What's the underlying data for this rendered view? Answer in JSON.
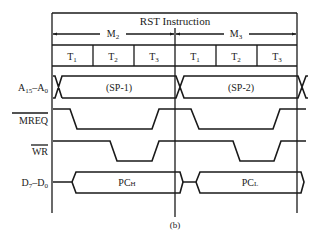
{
  "diagram": {
    "title": "RST Instruction",
    "caption": "(b)",
    "machine_cycles": [
      {
        "label": "M",
        "sub": "2",
        "states": [
          {
            "label": "T",
            "sub": "1"
          },
          {
            "label": "T",
            "sub": "2"
          },
          {
            "label": "T",
            "sub": "3"
          }
        ]
      },
      {
        "label": "M",
        "sub": "3",
        "states": [
          {
            "label": "T",
            "sub": "1"
          },
          {
            "label": "T",
            "sub": "2"
          },
          {
            "label": "T",
            "sub": "3"
          }
        ]
      }
    ],
    "signals": [
      {
        "name": "A15-A0",
        "label_main": "A",
        "label_sub1": "15",
        "label_mid": "–A",
        "label_sub2": "0",
        "type": "bus",
        "values": [
          "(SP-1)",
          "(SP-2)"
        ]
      },
      {
        "name": "MREQ",
        "label": "MREQ",
        "active_low": true,
        "type": "digital"
      },
      {
        "name": "WR",
        "label": "WR",
        "active_low": true,
        "type": "digital"
      },
      {
        "name": "D7-D0",
        "label_main": "D",
        "label_sub1": "7",
        "label_mid": "–D",
        "label_sub2": "0",
        "type": "bus",
        "values": [
          "PCH",
          "PCL"
        ],
        "value_parts": [
          {
            "main": "PC",
            "suffix": "H"
          },
          {
            "main": "PC",
            "suffix": "L"
          }
        ]
      }
    ]
  },
  "colors": {
    "line": "#1a1a1a",
    "background": "#ffffff"
  }
}
